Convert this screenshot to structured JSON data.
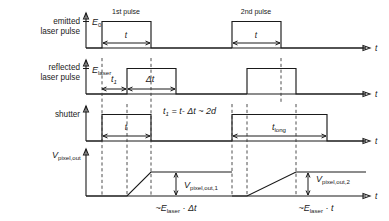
{
  "figure": {
    "type": "timing-diagram",
    "title": "",
    "axis_label_x": "t",
    "rows": [
      {
        "id": "emitted",
        "row_label_line1": "emitted",
        "row_label_line2": "laser pulse",
        "y_axis_label": "E",
        "y_axis_sub": "0",
        "annotations": [
          {
            "name": "first-pulse-label",
            "text": "1st pulse"
          },
          {
            "name": "second-pulse-label",
            "text": "2nd pulse"
          },
          {
            "name": "pulse1-width-label",
            "text": "t"
          },
          {
            "name": "pulse2-width-label",
            "text": "t"
          }
        ]
      },
      {
        "id": "reflected",
        "row_label_line1": "reflected",
        "row_label_line2": "laser pulse",
        "y_axis_label": "E",
        "y_axis_sub": "laser",
        "annotations": [
          {
            "name": "t1-delay-label",
            "text": "t",
            "sub": "1"
          },
          {
            "name": "delta-t-label",
            "text": "Δt"
          }
        ]
      },
      {
        "id": "shutter",
        "row_label_line1": "shutter",
        "row_label_line2": "",
        "y_axis_label": "",
        "y_axis_sub": "",
        "annotations": [
          {
            "name": "shutter-formula",
            "text": "t",
            "sub": "1",
            "rest": " = t - Δt ~ 2d"
          },
          {
            "name": "shutter-short-width-label",
            "text": "t"
          },
          {
            "name": "shutter-long-width-label",
            "text": "t",
            "sub": "long"
          }
        ]
      },
      {
        "id": "pixel-out",
        "row_label_line1": "V",
        "row_label_line2": "",
        "y_axis_label": "V",
        "y_axis_sub": "pixel,out",
        "annotations": [
          {
            "name": "vout1-label",
            "text": "V",
            "sub": "pixel,out,1"
          },
          {
            "name": "vout2-label",
            "text": "V",
            "sub": "pixel,out,2"
          },
          {
            "name": "proportional-1",
            "text": "~E",
            "sub": "laser",
            "rest": " · Δt"
          },
          {
            "name": "proportional-2",
            "text": "~E",
            "sub": "laser",
            "rest": " · t"
          }
        ]
      }
    ],
    "text": {
      "emitted_l1": "emitted",
      "emitted_l2": "laser pulse",
      "reflected_l1": "reflected",
      "reflected_l2": "laser pulse",
      "shutter_label": "shutter",
      "E0_base": "E",
      "E0_sub": "0",
      "Elaser_base": "E",
      "Elaser_sub": "laser",
      "Vpixel_base": "V",
      "Vpixel_sub": "pixel,out",
      "first_pulse": "1st pulse",
      "second_pulse": "2nd pulse",
      "t_width_1": "t",
      "t_width_2": "t",
      "t1_base": "t",
      "t1_sub": "1",
      "delta_t": "Δt",
      "shutter_formula_base": "t",
      "shutter_formula_sub": "1",
      "shutter_formula_rest": "= t- Δt ~ 2d",
      "shutter_t_short": "t",
      "t_long_base": "t",
      "t_long_sub": "long",
      "vout1_base": "V",
      "vout1_sub": "pixel,out,1",
      "vout2_base": "V",
      "vout2_sub": "pixel,out,2",
      "prop1_base": "~E",
      "prop1_sub": "laser",
      "prop1_rest": "· Δt",
      "prop2_base": "~E",
      "prop2_sub": "laser",
      "prop2_rest": "· t",
      "axis_t_1": "t",
      "axis_t_2": "t",
      "axis_t_3": "t",
      "axis_t_4": "t"
    },
    "colors": {
      "stroke": "#1a1a1a",
      "dashed": "#3a3a3a",
      "background": "#ffffff"
    }
  }
}
